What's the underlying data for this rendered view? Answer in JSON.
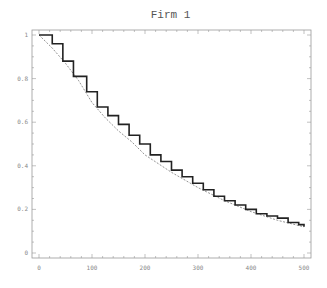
{
  "chart_data": {
    "type": "line",
    "title": "Firm 1",
    "xlabel": "",
    "ylabel": "",
    "xlim": [
      -10,
      515
    ],
    "ylim": [
      -0.02,
      1.03
    ],
    "xticks": [
      0,
      100,
      200,
      300,
      400,
      500
    ],
    "xtick_labels": [
      "0",
      "100",
      "200",
      "300",
      "400",
      "500"
    ],
    "yticks": [
      0,
      0.2,
      0.4,
      0.6,
      0.8,
      1
    ],
    "ytick_labels": [
      "0",
      "0.2",
      "0.4",
      "0.6",
      "0.8",
      "1"
    ],
    "grid": false,
    "legend": null,
    "series": [
      {
        "name": "empirical step",
        "style": "solid-step",
        "x": [
          0,
          25,
          45,
          65,
          90,
          110,
          130,
          150,
          170,
          190,
          210,
          230,
          250,
          270,
          290,
          310,
          330,
          350,
          370,
          390,
          410,
          430,
          450,
          470,
          490,
          500
        ],
        "y": [
          1.0,
          0.96,
          0.88,
          0.81,
          0.74,
          0.67,
          0.63,
          0.59,
          0.54,
          0.5,
          0.45,
          0.42,
          0.38,
          0.35,
          0.32,
          0.29,
          0.26,
          0.24,
          0.22,
          0.2,
          0.18,
          0.17,
          0.16,
          0.14,
          0.13,
          0.12
        ]
      },
      {
        "name": "fitted curve",
        "style": "dashed",
        "x": [
          0,
          25,
          50,
          75,
          100,
          125,
          150,
          175,
          200,
          250,
          300,
          350,
          400,
          450,
          500
        ],
        "y": [
          1.0,
          0.94,
          0.87,
          0.79,
          0.69,
          0.62,
          0.56,
          0.51,
          0.45,
          0.37,
          0.3,
          0.24,
          0.19,
          0.15,
          0.12
        ]
      }
    ]
  },
  "layout": {
    "frame": {
      "left": 32,
      "top": 30,
      "right": 311,
      "bottom": 258
    },
    "x0_px": 39,
    "x500_px": 304,
    "y0_px": 253,
    "y1_px": 35,
    "line_color": "#222222",
    "frame_color": "#999999",
    "dash_color": "#777777"
  }
}
